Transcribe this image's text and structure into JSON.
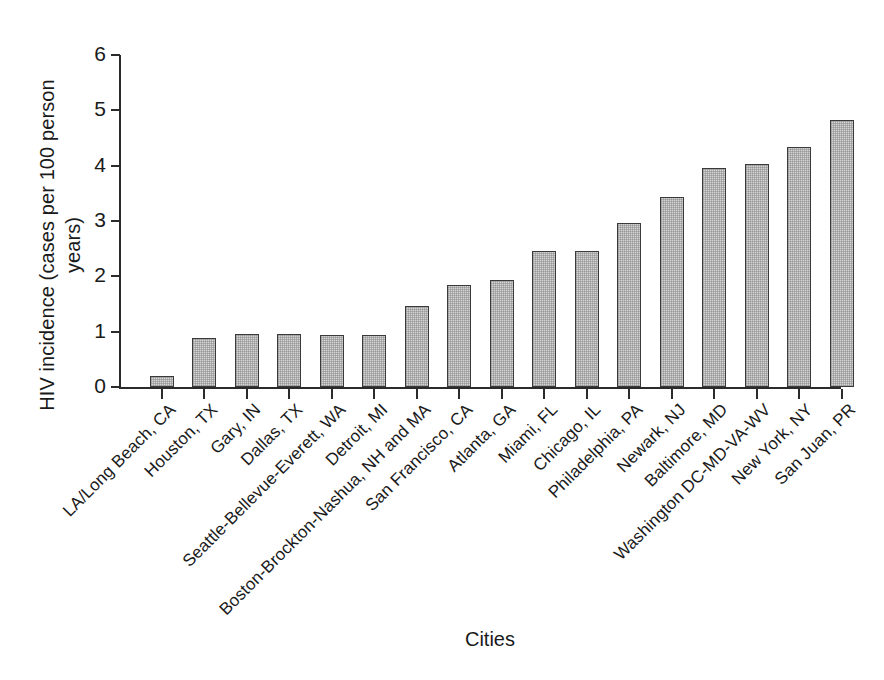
{
  "chart_data": {
    "type": "bar",
    "title": "",
    "xlabel": "Cities",
    "ylabel": "HIV incidence (cases per 100 person\nyears)",
    "ylim": [
      0,
      6
    ],
    "yticks": [
      0,
      1,
      2,
      3,
      4,
      5,
      6
    ],
    "ytick_labels": [
      "0",
      "1",
      "2",
      "3",
      "4",
      "5",
      "6"
    ],
    "grid": false,
    "legend": "none",
    "bar_fill_color": "#d4d4d4",
    "bar_edge_color": "#3a3a3a",
    "axis_color": "#2b2b2b",
    "categories": [
      "LA/Long Beach, CA",
      "Houston, TX",
      "Gary, IN",
      "Dallas, TX",
      "Seattle-Bellevue-Everett, WA",
      "Detroit, MI",
      "Boston-Brockton-Nashua, NH and MA",
      "San Francisco, CA",
      "Atlanta, GA",
      "Miami, FL",
      "Chicago, IL",
      "Philadelphia, PA",
      "Newark, NJ",
      "Baltimore, MD",
      "Washington DC-MD-VA-WV",
      "New York, NY",
      "San Juan, PR"
    ],
    "values": [
      0.2,
      0.88,
      0.95,
      0.95,
      0.94,
      0.94,
      1.46,
      1.85,
      1.93,
      2.46,
      2.46,
      2.96,
      3.43,
      3.95,
      4.03,
      4.34,
      4.82
    ]
  }
}
